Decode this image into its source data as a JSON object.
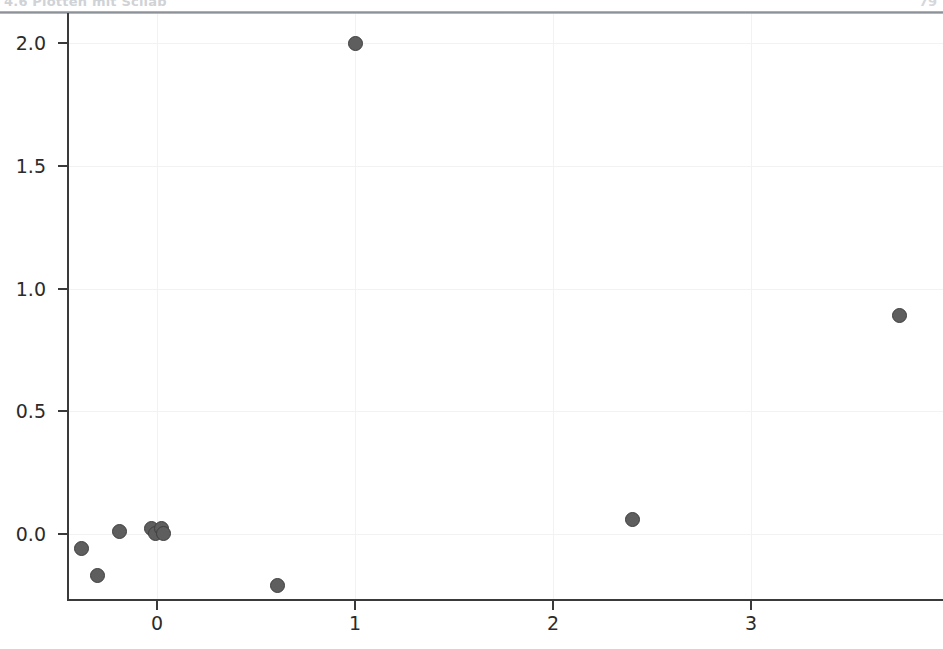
{
  "page_header": {
    "left_text": "4.6   Plotten mit Scilab",
    "right_text": "79"
  },
  "chart_data": {
    "type": "scatter",
    "title": "",
    "xlabel": "",
    "ylabel": "",
    "xlim": [
      -0.45,
      3.97
    ],
    "ylim": [
      -0.27,
      2.12
    ],
    "grid": true,
    "legend": false,
    "xticks": [
      0,
      1,
      2,
      3
    ],
    "xtick_labels": [
      "0",
      "1",
      "2",
      "3"
    ],
    "yticks": [
      0.0,
      0.5,
      1.0,
      1.5,
      2.0
    ],
    "ytick_labels": [
      "0.0",
      "0.5",
      "1.0",
      "1.5",
      "2.0"
    ],
    "marker": {
      "shape": "circle",
      "face_color": "#5e5e5e",
      "edge_color": "#3f3f3f",
      "size_px": 15
    },
    "grid_color": "#f2f2f2",
    "axis_color": "#3a3a3a",
    "background_color": "#ffffff",
    "series": [
      {
        "name": "data",
        "points": [
          {
            "x": -0.38,
            "y": -0.06
          },
          {
            "x": -0.3,
            "y": -0.17
          },
          {
            "x": -0.19,
            "y": 0.01
          },
          {
            "x": -0.03,
            "y": 0.02
          },
          {
            "x": -0.01,
            "y": 0.0
          },
          {
            "x": 0.02,
            "y": 0.02
          },
          {
            "x": 0.03,
            "y": 0.0
          },
          {
            "x": 0.61,
            "y": -0.21
          },
          {
            "x": 1.0,
            "y": 2.0
          },
          {
            "x": 2.4,
            "y": 0.06
          },
          {
            "x": 3.75,
            "y": 0.89
          }
        ]
      }
    ]
  }
}
